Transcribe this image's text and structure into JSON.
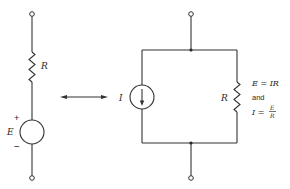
{
  "figure": {
    "type": "circuit-equivalence"
  },
  "left_circuit": {
    "name": "Thevenin voltage source",
    "resistor_label": "R",
    "source_label": "E",
    "plus_sign": "+",
    "minus_sign": "−"
  },
  "equivalence_arrow": {
    "type": "double-headed",
    "icon": "double-arrow-icon"
  },
  "right_circuit": {
    "name": "Norton current source",
    "source_label": "I",
    "resistor_label": "R",
    "equations": {
      "eq1": "E = IR",
      "connector": "and",
      "eq2_lhs": "I =",
      "eq2_num": "E",
      "eq2_den": "R"
    }
  },
  "colors": {
    "line": "#333333",
    "text": "#2a2a2a",
    "background": "#ffffff"
  }
}
